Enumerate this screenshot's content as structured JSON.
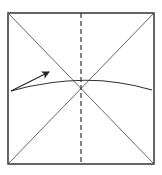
{
  "diagram": {
    "type": "origami-fold-step",
    "square": {
      "x": 8,
      "y": 13,
      "w": 146,
      "h": 151,
      "stroke": "#333333"
    },
    "diagonals": {
      "stroke": "#555555"
    },
    "valley_fold_line": {
      "x": 81,
      "y1": 13,
      "y2": 164,
      "style": "dashed",
      "stroke": "#333333"
    },
    "fold_curve": {
      "d": "M 11 91 Q 85 70 152 90",
      "stroke": "#333333"
    },
    "arrow": {
      "x1": 11,
      "y1": 91,
      "x2": 49,
      "y2": 72,
      "stroke": "#222222"
    }
  }
}
